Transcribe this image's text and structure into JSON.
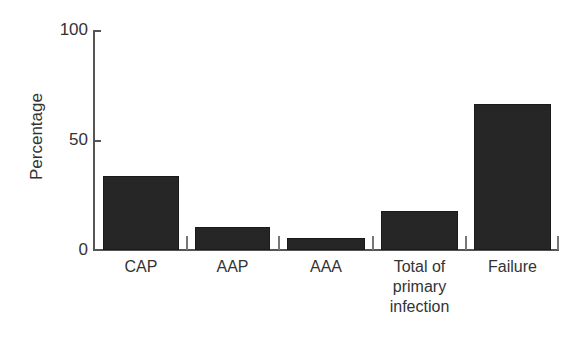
{
  "chart_data": {
    "type": "bar",
    "title": "",
    "xlabel": "",
    "ylabel": "Percentage",
    "ylim": [
      0,
      100
    ],
    "yticks": [
      "0",
      "50",
      "100"
    ],
    "grid": false,
    "legend": null,
    "categories": [
      "CAP",
      "AAP",
      "AAA",
      "Total of primary infection",
      "Failure"
    ],
    "category_lines": [
      [
        "CAP"
      ],
      [
        "AAP"
      ],
      [
        "AAA"
      ],
      [
        "Total of",
        "primary",
        "infection"
      ],
      [
        "Failure"
      ]
    ],
    "values": [
      33.5,
      10.5,
      5.5,
      17.7,
      66.5
    ],
    "bar_color": "#262626"
  }
}
